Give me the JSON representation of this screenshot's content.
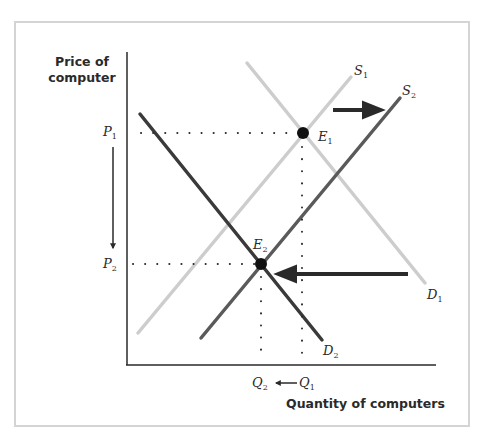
{
  "diagram": {
    "y_axis_label_line1": "Price of",
    "y_axis_label_line2": "computer",
    "x_axis_label": "Quantity of computers",
    "price_levels": [
      {
        "id": "P1",
        "letter": "P",
        "sub": "1"
      },
      {
        "id": "P2",
        "letter": "P",
        "sub": "2"
      }
    ],
    "quantity_levels": [
      {
        "id": "Q2",
        "letter": "Q",
        "sub": "2"
      },
      {
        "id": "Q1",
        "letter": "Q",
        "sub": "1"
      }
    ],
    "curves": [
      {
        "id": "S1",
        "letter": "S",
        "sub": "1",
        "type": "supply",
        "color": "#c8c8c8"
      },
      {
        "id": "S2",
        "letter": "S",
        "sub": "2",
        "type": "supply",
        "color": "#5a5a5a"
      },
      {
        "id": "D1",
        "letter": "D",
        "sub": "1",
        "type": "demand",
        "color": "#c8c8c8"
      },
      {
        "id": "D2",
        "letter": "D",
        "sub": "2",
        "type": "demand",
        "color": "#3a3a3a"
      }
    ],
    "equilibria": [
      {
        "id": "E1",
        "letter": "E",
        "sub": "1"
      },
      {
        "id": "E2",
        "letter": "E",
        "sub": "2"
      }
    ],
    "shifts": [
      {
        "name": "supply-shift-right",
        "direction": "right"
      },
      {
        "name": "demand-shift-left",
        "direction": "left"
      },
      {
        "name": "price-fall",
        "direction": "down"
      },
      {
        "name": "quantity-fall",
        "direction": "left"
      }
    ],
    "colors": {
      "axis": "#2a2a2a",
      "light_curve": "#c8c8c8",
      "dark_curve": "#3a3a3a",
      "frame": "#d4d4d4"
    }
  }
}
